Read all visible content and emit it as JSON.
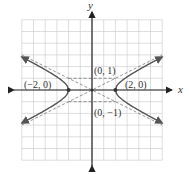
{
  "chart_data": {
    "type": "line",
    "title": "",
    "equation": "x^2/4 - y^2 = 1",
    "xlabel": "x",
    "ylabel": "y",
    "xlim": [
      -6,
      6
    ],
    "ylim": [
      -6,
      6
    ],
    "grid": true,
    "series": [
      {
        "name": "hyperbola-right-branch",
        "style": "solid",
        "x": [
          6,
          5,
          4,
          3,
          2,
          3,
          4,
          5,
          6
        ],
        "y": [
          2.83,
          2.29,
          1.73,
          1.12,
          0,
          -1.12,
          -1.73,
          -2.29,
          -2.83
        ]
      },
      {
        "name": "hyperbola-left-branch",
        "style": "solid",
        "x": [
          -6,
          -5,
          -4,
          -3,
          -2,
          -3,
          -4,
          -5,
          -6
        ],
        "y": [
          2.83,
          2.29,
          1.73,
          1.12,
          0,
          -1.12,
          -1.73,
          -2.29,
          -2.83
        ]
      },
      {
        "name": "asymptote-positive",
        "style": "dashed",
        "x": [
          -6,
          6
        ],
        "y": [
          -3,
          3
        ]
      },
      {
        "name": "asymptote-negative",
        "style": "dashed",
        "x": [
          -6,
          6
        ],
        "y": [
          3,
          -3
        ]
      },
      {
        "name": "fundamental-rectangle",
        "style": "dashed",
        "x": [
          -2,
          2,
          2,
          -2,
          -2
        ],
        "y": [
          1,
          1,
          -1,
          -1,
          1
        ]
      }
    ],
    "annotations": [
      {
        "text": "(−2, 0)",
        "x": -2,
        "y": 0
      },
      {
        "text": "(2, 0)",
        "x": 2,
        "y": 0
      },
      {
        "text": "(0, 1)",
        "x": 0,
        "y": 1
      },
      {
        "text": "(0, −1)",
        "x": 0,
        "y": -1
      }
    ]
  },
  "labels": {
    "x_axis": "x",
    "y_axis": "y",
    "vertex_left": "(−2, 0)",
    "vertex_right": "(2, 0)",
    "covertex_top": "(0, 1)",
    "covertex_bottom": "(0, −1)"
  }
}
